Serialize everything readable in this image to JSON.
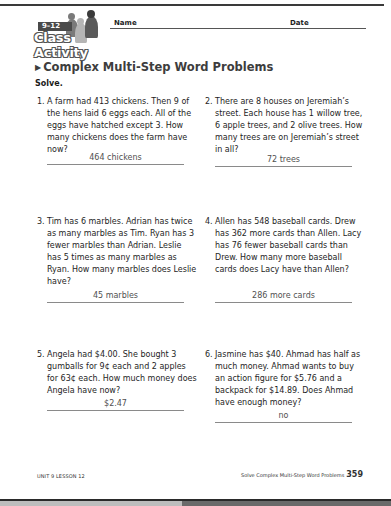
{
  "header": {
    "grade_band": "9–12",
    "logo_text": "Class Activity",
    "name_label": "Name",
    "date_label": "Date"
  },
  "title": "Complex Multi-Step Word Problems",
  "instruction": "Solve.",
  "problems": [
    {
      "number": "1.",
      "text": "A farm had 413 chickens. Then 9 of the hens laid 6 eggs each. All of the eggs have hatched except 3. How many chickens does the farm have now?",
      "answer": "464 chickens"
    },
    {
      "number": "2.",
      "text": "There are 8 houses on Jeremiah’s street. Each house has 1 willow tree, 6 apple trees, and 2 olive trees. How many trees are on Jeremiah’s street in all?",
      "answer": "72 trees"
    },
    {
      "number": "3.",
      "text": "Tim has 6 marbles. Adrian has twice as many marbles as Tim. Ryan has 3 fewer marbles than Adrian. Leslie has 5 times as many marbles as Ryan. How many marbles does Leslie have?",
      "answer": "45 marbles"
    },
    {
      "number": "4.",
      "text": "Allen has 548 baseball cards. Drew has 362 more cards than Allen. Lacy has 76 fewer baseball cards than Drew. How many more baseball cards does Lacy have than Allen?",
      "answer": "286 more cards"
    },
    {
      "number": "5.",
      "text": "Angela had $4.00. She bought 3 gumballs for 9¢ each and 2 apples for 63¢ each. How much money does Angela have now?",
      "answer": "$2.47"
    },
    {
      "number": "6.",
      "text": "Jasmine has $40. Ahmad has half as much money. Ahmad wants to buy an action figure for $5.76 and a backpack for $14.89. Does Ahmad have enough money?",
      "answer": "no"
    }
  ],
  "footer": {
    "left": "UNIT 9 LESSON 12",
    "right": "Solve Complex Multi-Step Word Problems",
    "page_number": "359"
  },
  "colors": {
    "title": "#3d3d3d",
    "answer_text": "#505050",
    "rule": "#3a3a3a"
  }
}
